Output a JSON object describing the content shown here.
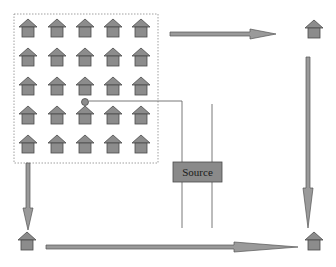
{
  "diagram": {
    "type": "network-flow",
    "colors": {
      "house_fill": "#8c8c8c",
      "house_stroke": "#4a4a4a",
      "arrow_fill": "#9a9a9a",
      "arrow_stroke": "#555555",
      "source_fill": "#8a8a8a",
      "line": "#6a6a6a",
      "dotted_border": "#888888"
    },
    "cluster": {
      "label": "house-grid",
      "rows": 5,
      "cols": 5,
      "highlighted_node": {
        "row": 3,
        "col": 3
      }
    },
    "source": {
      "label": "Source"
    },
    "corner_nodes": [
      "top-right-house",
      "bottom-left-house",
      "bottom-right-house"
    ],
    "arrows": [
      {
        "from": "cluster",
        "to": "top-right-house",
        "direction": "right"
      },
      {
        "from": "top-right-house",
        "to": "bottom-right-house",
        "direction": "down"
      },
      {
        "from": "cluster",
        "to": "bottom-left-house",
        "direction": "down"
      },
      {
        "from": "bottom-left-house",
        "to": "bottom-right-house",
        "direction": "right"
      }
    ]
  }
}
